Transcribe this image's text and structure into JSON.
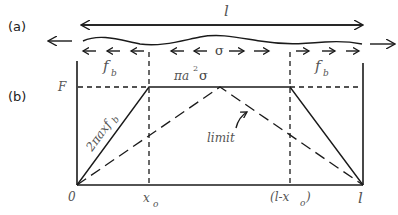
{
  "figure": {
    "panel_a": {
      "label": "(a)",
      "length_symbol": "l",
      "stress_symbol": "σ",
      "left_arrows_count": 5,
      "right_arrows_count": 5
    },
    "panel_b": {
      "label": "(b)",
      "y_axis_label": "F",
      "region_labels": {
        "left_friction": "f",
        "left_friction_sub": "b",
        "middle": "πa",
        "middle_sup": "2",
        "middle_tail": "σ",
        "right_friction": "f",
        "right_friction_sub": "b"
      },
      "slope_label": "2πaxf",
      "slope_label_sub": "b",
      "limit_label": "limit",
      "x_ticks": {
        "origin": "0",
        "x0": "x",
        "x0_sub": "o",
        "l_minus_x0_open": "(l-x",
        "l_minus_x0_sub": "o",
        "l_minus_x0_close": ")",
        "l": "l"
      }
    }
  },
  "colors": {
    "ink": "#1a1a1a",
    "label": "#555555",
    "background": "#ffffff"
  }
}
